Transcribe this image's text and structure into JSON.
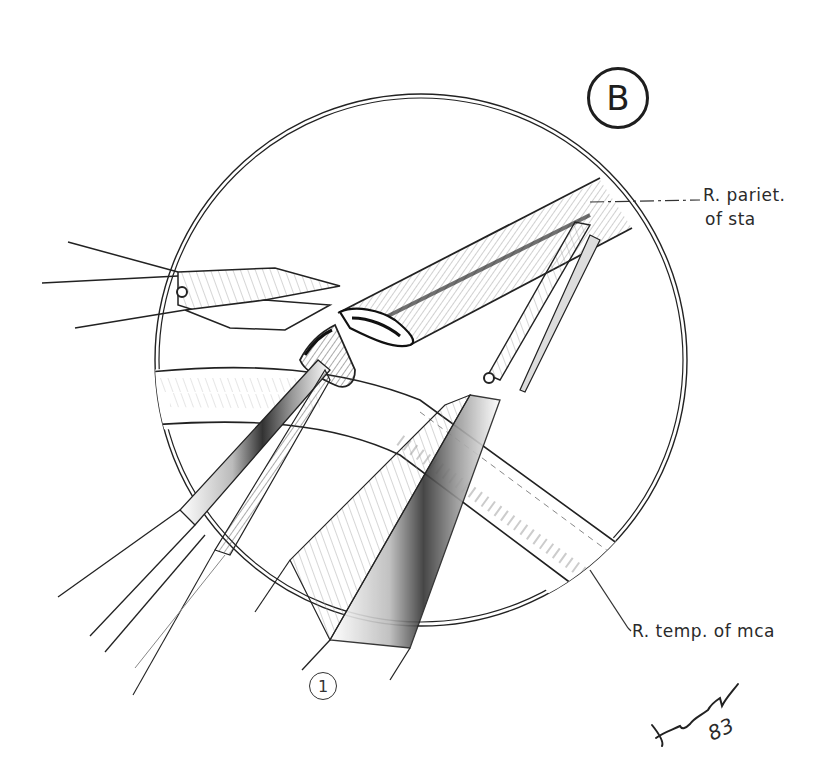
{
  "figure": {
    "panel_label": "B",
    "step_marker": "1",
    "labels": {
      "parietal_line1": "R. pariet.",
      "parietal_line2": "of sta",
      "temporal": "R. temp. of mca"
    },
    "signature": {
      "initials_icon": "handwritten-signature",
      "year": "83"
    },
    "colors": {
      "ink": "#1e1e1e",
      "background": "#ffffff",
      "hatch": "#555555"
    }
  }
}
